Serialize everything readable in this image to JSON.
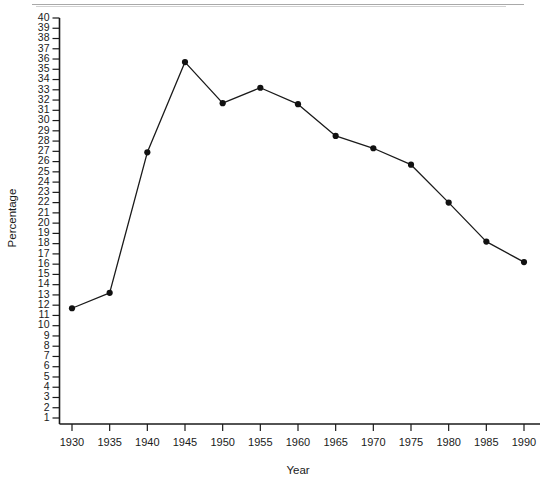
{
  "chart_data": {
    "type": "line",
    "title": "",
    "subtitle": "",
    "xlabel": "Year",
    "ylabel": "Percentage",
    "x": [
      1930,
      1935,
      1940,
      1945,
      1950,
      1955,
      1960,
      1965,
      1970,
      1975,
      1980,
      1985,
      1990
    ],
    "values": [
      11.7,
      13.2,
      26.9,
      35.7,
      31.7,
      33.2,
      31.6,
      28.5,
      27.3,
      25.7,
      22.0,
      18.2,
      16.2
    ],
    "series": [
      {
        "name": "Percentage",
        "values": [
          11.7,
          13.2,
          26.9,
          35.7,
          31.7,
          33.2,
          31.6,
          28.5,
          27.3,
          25.7,
          22.0,
          18.2,
          16.2
        ]
      }
    ],
    "xlim": [
      1928,
      1992
    ],
    "ylim": [
      1,
      40
    ],
    "xticks": [
      1930,
      1935,
      1940,
      1945,
      1950,
      1955,
      1960,
      1965,
      1970,
      1975,
      1980,
      1985,
      1990
    ],
    "xtick_labels": [
      "1930",
      "1935",
      "1940",
      "1945",
      "1950",
      "1955",
      "1960",
      "1965",
      "1970",
      "1975",
      "1980",
      "1985",
      "1990"
    ],
    "yticks": [
      1,
      2,
      3,
      4,
      5,
      6,
      7,
      8,
      9,
      10,
      11,
      12,
      13,
      14,
      15,
      16,
      17,
      18,
      19,
      20,
      21,
      22,
      23,
      24,
      25,
      26,
      27,
      28,
      29,
      30,
      31,
      32,
      33,
      34,
      35,
      36,
      37,
      38,
      39,
      40
    ],
    "ytick_labels": [
      "1",
      "2",
      "3",
      "4",
      "5",
      "6",
      "7",
      "8",
      "9",
      "10",
      "11",
      "12",
      "13",
      "14",
      "15",
      "16",
      "17",
      "18",
      "19",
      "20",
      "21",
      "22",
      "23",
      "24",
      "25",
      "26",
      "27",
      "28",
      "29",
      "30",
      "31",
      "32",
      "33",
      "34",
      "35",
      "36",
      "37",
      "38",
      "39",
      "40"
    ],
    "grid": false,
    "legend": null,
    "legend_position": "none",
    "marker": "filled-circle",
    "line_color": "#1a1a1a",
    "marker_color": "#111111",
    "background_color": "#ffffff",
    "annotations": []
  }
}
